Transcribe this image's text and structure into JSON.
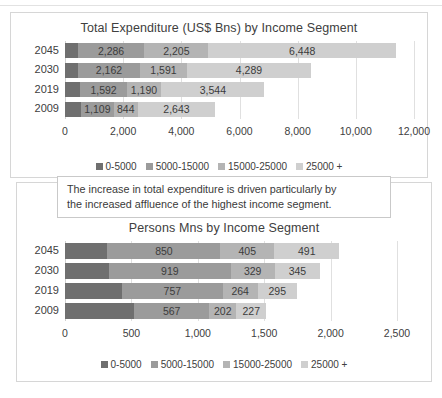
{
  "palette": {
    "seg1": "#6f6f6f",
    "seg2": "#9b9b9b",
    "seg3": "#b4b4b4",
    "seg4": "#cfcfcf",
    "grid": "#e0e0e0",
    "text": "#404040",
    "card_border": "#d6d6d6",
    "callout_border": "#c9c9c9",
    "background": "#ffffff"
  },
  "legend": {
    "items": [
      {
        "label": "0-5000",
        "color": "#6f6f6f"
      },
      {
        "label": "5000-15000",
        "color": "#9b9b9b"
      },
      {
        "label": "15000-25000",
        "color": "#b4b4b4"
      },
      {
        "label": "25000 +",
        "color": "#cfcfcf"
      }
    ]
  },
  "callout": {
    "line1": "The increase in total expenditure is driven particularly by",
    "line2": "the increased affluence of the highest income segment."
  },
  "chart_data": [
    {
      "id": "expenditure",
      "type": "bar",
      "orientation": "horizontal",
      "stacked": true,
      "title": "Total Expenditure (US$ Bns) by Income Segment",
      "xlabel": "",
      "ylabel": "",
      "xlim": [
        0,
        12000
      ],
      "xticks": [
        0,
        2000,
        4000,
        6000,
        8000,
        10000,
        12000
      ],
      "xticklabels": [
        "0",
        "2,000",
        "4,000",
        "6,000",
        "8,000",
        "10,000",
        "12,000"
      ],
      "grid": true,
      "legend_position": "bottom",
      "categories": [
        "2045",
        "2030",
        "2019",
        "2009"
      ],
      "series": [
        {
          "name": "0-5000",
          "color": "#6f6f6f",
          "values": [
            442,
            430,
            530,
            560
          ],
          "labels": [
            "",
            "",
            "",
            ""
          ]
        },
        {
          "name": "5000-15000",
          "color": "#9b9b9b",
          "values": [
            2286,
            2162,
            1592,
            1109
          ],
          "labels": [
            "2,286",
            "2,162",
            "1,592",
            "1,109"
          ]
        },
        {
          "name": "15000-25000",
          "color": "#b4b4b4",
          "values": [
            2205,
            1591,
            1190,
            844
          ],
          "labels": [
            "2,205",
            "1,591",
            "1,190",
            "844"
          ]
        },
        {
          "name": "25000 +",
          "color": "#cfcfcf",
          "values": [
            6448,
            4289,
            3544,
            2643
          ],
          "labels": [
            "6,448",
            "4,289",
            "3,544",
            "2,643"
          ]
        }
      ]
    },
    {
      "id": "persons",
      "type": "bar",
      "orientation": "horizontal",
      "stacked": true,
      "title": "Persons Mns by Income Segment",
      "xlabel": "",
      "ylabel": "",
      "xlim": [
        0,
        2500
      ],
      "xticks": [
        0,
        500,
        1000,
        1500,
        2000,
        2500
      ],
      "xticklabels": [
        "0",
        "500",
        "1,000",
        "1,500",
        "2,000",
        "2,500"
      ],
      "grid": true,
      "legend_position": "bottom",
      "categories": [
        "2045",
        "2030",
        "2019",
        "2009"
      ],
      "series": [
        {
          "name": "0-5000",
          "color": "#6f6f6f",
          "values": [
            320,
            330,
            430,
            520
          ],
          "labels": [
            "",
            "",
            "",
            ""
          ]
        },
        {
          "name": "5000-15000",
          "color": "#9b9b9b",
          "values": [
            850,
            919,
            757,
            567
          ],
          "labels": [
            "850",
            "919",
            "757",
            "567"
          ]
        },
        {
          "name": "15000-25000",
          "color": "#b4b4b4",
          "values": [
            405,
            329,
            264,
            202
          ],
          "labels": [
            "405",
            "329",
            "264",
            "202"
          ]
        },
        {
          "name": "25000 +",
          "color": "#cfcfcf",
          "values": [
            491,
            345,
            295,
            227
          ],
          "labels": [
            "491",
            "345",
            "295",
            "227"
          ]
        }
      ]
    }
  ]
}
